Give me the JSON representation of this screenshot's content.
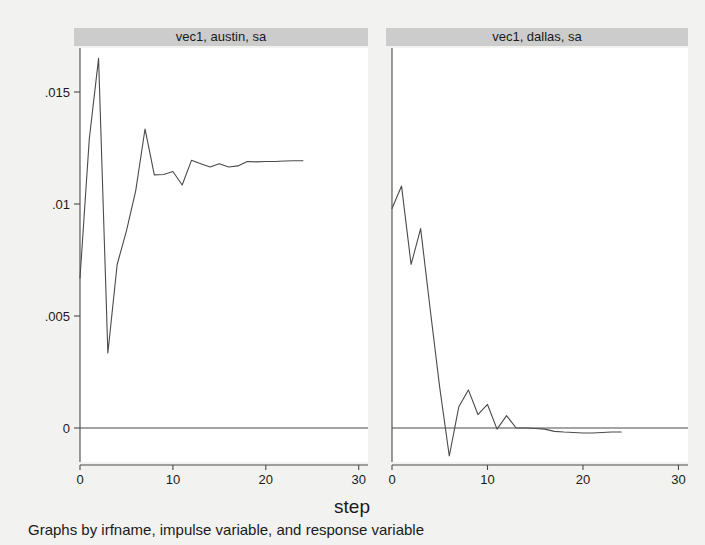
{
  "figure": {
    "width": 705,
    "height": 545,
    "background_color": "#f2f2f0",
    "panel_background_color": "#ffffff",
    "panel_title_bar_color": "#cccccc",
    "line_color": "#4a4a4a",
    "axis_color": "#4a4a4a",
    "axis_title": "step",
    "note": "Graphs by irfname, impulse variable, and response variable"
  },
  "chart_data": {
    "type": "line",
    "title": "",
    "subtitle": "",
    "xlabel": "step",
    "ylabel": "",
    "note": "Graphs by irfname, impulse variable, and response variable",
    "grid": false,
    "legend": "none",
    "shared_y_axis": true,
    "xlim": [
      0,
      31
    ],
    "ylim": [
      -0.0018,
      0.0172
    ],
    "xticks": [
      0,
      10,
      20,
      30
    ],
    "xticklabels": [
      "0",
      "10",
      "20",
      "30"
    ],
    "yticks": [
      0,
      0.005,
      0.01,
      0.015
    ],
    "yticklabels": [
      "0",
      ".005",
      ".01",
      ".015"
    ],
    "panels": [
      {
        "label": "vec1, austin, sa",
        "x": [
          0,
          1,
          2,
          3,
          4,
          5,
          6,
          7,
          8,
          9,
          10,
          11,
          12,
          13,
          14,
          15,
          16,
          17,
          18,
          19,
          20,
          21,
          22,
          23,
          24
        ],
        "y": [
          0.0067,
          0.0129,
          0.0165,
          0.00335,
          0.0073,
          0.0088,
          0.0106,
          0.01335,
          0.0113,
          0.01132,
          0.01145,
          0.01085,
          0.01195,
          0.0118,
          0.01165,
          0.0118,
          0.01165,
          0.0117,
          0.0119,
          0.01188,
          0.0119,
          0.0119,
          0.01192,
          0.01193,
          0.01193
        ]
      },
      {
        "label": "vec1, dallas, sa",
        "x": [
          0,
          1,
          2,
          3,
          4,
          5,
          6,
          7,
          8,
          9,
          10,
          11,
          12,
          13,
          14,
          15,
          16,
          17,
          18,
          19,
          20,
          21,
          22,
          23,
          24
        ],
        "y": [
          0.0098,
          0.0108,
          0.0073,
          0.0089,
          0.0053,
          0.0018,
          -0.00125,
          0.00095,
          0.0017,
          0.0006,
          0.00105,
          -5e-05,
          0.00055,
          0.0,
          0.0,
          -2e-05,
          -5e-05,
          -0.00015,
          -0.00018,
          -0.0002,
          -0.00022,
          -0.00022,
          -0.0002,
          -0.00018,
          -0.00018
        ]
      }
    ]
  },
  "geometry": {
    "panels": [
      {
        "plot_left": 80,
        "plot_right": 368,
        "title_bar_left": 74,
        "title_bar_right": 368
      },
      {
        "plot_left": 392,
        "plot_right": 688,
        "title_bar_left": 386,
        "title_bar_right": 688
      }
    ],
    "plot_top": 48,
    "plot_bottom": 462,
    "title_bar_top": 28,
    "title_bar_height": 18,
    "y_pixel_zero": 428,
    "y_pixel_per_unit": 22400,
    "x_pixel_per_step": 9.6,
    "axis_title_xy": [
      352,
      513
    ],
    "note_xy": [
      28,
      535
    ]
  }
}
